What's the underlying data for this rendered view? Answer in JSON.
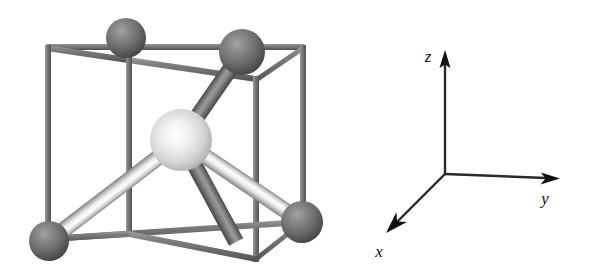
{
  "figure": {
    "title": "",
    "type": "crystal-structure-diagram",
    "background_color": "#ffffff"
  },
  "crystal": {
    "name": "tetrahedral-unit-cell",
    "cell_shape": "cube",
    "cell_edge_color": "#7a7a7a",
    "cell_edge_highlight": "#b8b8b8",
    "cell_edge_shadow": "#4e4e4e",
    "central_atom": {
      "name": "central-atom",
      "color": "#e8e8e8",
      "shade_color": "#8f8f8f",
      "cx": 181,
      "cy": 140,
      "r": 31
    },
    "corner_atoms": [
      {
        "name": "corner-atom-top-back-left",
        "color": "#6f6f6f",
        "shade_color": "#3b3b3b",
        "cx": 126,
        "cy": 38,
        "r": 20
      },
      {
        "name": "corner-atom-top-back-right",
        "color": "#6f6f6f",
        "shade_color": "#3b3b3b",
        "cx": 242,
        "cy": 52,
        "r": 23
      },
      {
        "name": "corner-atom-bottom-front-left",
        "color": "#6f6f6f",
        "shade_color": "#3b3b3b",
        "cx": 49,
        "cy": 241,
        "r": 20
      },
      {
        "name": "corner-atom-bottom-front-right",
        "color": "#6f6f6f",
        "shade_color": "#3b3b3b",
        "cx": 302,
        "cy": 222,
        "r": 21
      }
    ],
    "bonds": [
      {
        "name": "bond-center-to-top-back-left",
        "style": "dark",
        "x1": 181,
        "y1": 140,
        "x2": 126,
        "y2": 38,
        "width": 16
      },
      {
        "name": "bond-center-to-top-back-right",
        "style": "dark",
        "x1": 181,
        "y1": 140,
        "x2": 242,
        "y2": 52,
        "width": 16
      },
      {
        "name": "bond-center-to-bottom-front-left",
        "style": "light",
        "x1": 181,
        "y1": 140,
        "x2": 49,
        "y2": 241,
        "width": 16
      },
      {
        "name": "bond-center-to-bottom-front-right",
        "style": "light",
        "x1": 181,
        "y1": 140,
        "x2": 302,
        "y2": 222,
        "width": 16
      }
    ]
  },
  "axes": {
    "name": "coordinate-axes",
    "origin": {
      "x": 445,
      "y": 174
    },
    "line_color": "#1b1b1b",
    "items": [
      {
        "name": "axis-z",
        "label": "z",
        "tip_x": 445,
        "tip_y": 53,
        "label_x": 428,
        "label_y": 62
      },
      {
        "name": "axis-y",
        "label": "y",
        "tip_x": 558,
        "tip_y": 178,
        "label_x": 545,
        "label_y": 203
      },
      {
        "name": "axis-x",
        "label": "x",
        "tip_x": 389,
        "tip_y": 228,
        "label_x": 378,
        "label_y": 255
      }
    ]
  }
}
